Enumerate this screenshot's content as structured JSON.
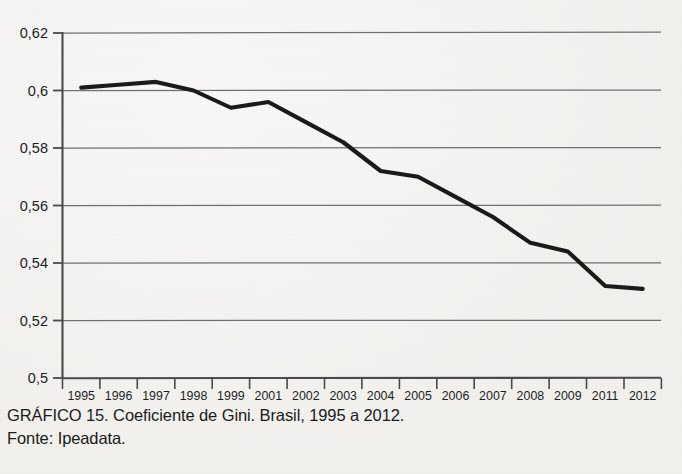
{
  "figure": {
    "caption": "GRÁFICO 15. Coeficiente de Gini. Brasil, 1995 a 2012.",
    "source": "Fonte: Ipeadata."
  },
  "chart_data": {
    "type": "line",
    "title": "GRÁFICO 15. Coeficiente de Gini. Brasil, 1995 a 2012.",
    "subtitle": "Fonte: Ipeadata.",
    "xlabel": "",
    "ylabel": "",
    "categories": [
      "1995",
      "1996",
      "1997",
      "1998",
      "1999",
      "2001",
      "2002",
      "2003",
      "2004",
      "2005",
      "2006",
      "2007",
      "2008",
      "2009",
      "2011",
      "2012"
    ],
    "values": [
      0.601,
      0.602,
      0.603,
      0.6,
      0.594,
      0.596,
      0.589,
      0.582,
      0.572,
      0.57,
      0.563,
      0.556,
      0.547,
      0.544,
      0.532,
      0.531
    ],
    "series": [
      {
        "name": "Coeficiente de Gini",
        "values": [
          0.601,
          0.602,
          0.603,
          0.6,
          0.594,
          0.596,
          0.589,
          0.582,
          0.572,
          0.57,
          0.563,
          0.556,
          0.547,
          0.544,
          0.532,
          0.531
        ]
      }
    ],
    "ylim": [
      0.5,
      0.62
    ],
    "yticks": [
      0.5,
      0.52,
      0.54,
      0.56,
      0.58,
      0.6,
      0.62
    ],
    "ytick_labels": [
      "0,5",
      "0,52",
      "0,54",
      "0,56",
      "0,58",
      "0,6",
      "0,62"
    ],
    "xtick_labels": [
      "1995",
      "1996",
      "1997",
      "1998",
      "1999",
      "2001",
      "2002",
      "2003",
      "2004",
      "2005",
      "2006",
      "2007",
      "2008",
      "2009",
      "2011",
      "2012"
    ],
    "grid": true,
    "grid_axis": "y",
    "legend": false,
    "legend_position": "none",
    "line_color": "#1a1a1a",
    "grid_color": "#6e6e6e",
    "axis_color": "#555555",
    "background_color": "#f2f1ee",
    "note": "Anos 2000 e 2010 ausentes (sem PNAD)."
  }
}
